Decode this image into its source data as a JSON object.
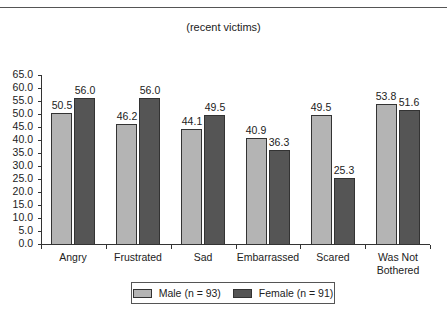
{
  "chart_data": {
    "type": "bar",
    "title": "(recent victims)",
    "xlabel": "",
    "ylabel": "",
    "ylim": [
      0,
      65
    ],
    "yticks": [
      "0.0",
      "5.0",
      "10.0",
      "15.0",
      "20.0",
      "25.0",
      "30.0",
      "35.0",
      "40.0",
      "45.0",
      "50.0",
      "55.0",
      "60.0",
      "65.0"
    ],
    "categories": [
      "Angry",
      "Frustrated",
      "Sad",
      "Embarrassed",
      "Scared",
      "Was Not Bothered"
    ],
    "category_lines": [
      [
        "Angry"
      ],
      [
        "Frustrated"
      ],
      [
        "Sad"
      ],
      [
        "Embarrassed"
      ],
      [
        "Scared"
      ],
      [
        "Was Not",
        "Bothered"
      ]
    ],
    "series": [
      {
        "name": "Male (n = 93)",
        "color": "#b4b4b4",
        "values": [
          50.5,
          46.2,
          44.1,
          40.9,
          49.5,
          53.8
        ]
      },
      {
        "name": "Female (n = 91)",
        "color": "#555555",
        "values": [
          56.0,
          56.0,
          49.5,
          36.3,
          25.3,
          51.6
        ]
      }
    ],
    "grid": false,
    "legend_position": "bottom"
  }
}
